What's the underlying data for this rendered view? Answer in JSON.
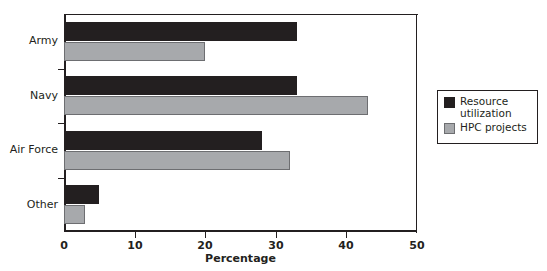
{
  "chart_data": {
    "type": "bar",
    "orientation": "horizontal",
    "title": "",
    "xlabel": "Percentage",
    "ylabel": "",
    "categories": [
      "Army",
      "Navy",
      "Air Force",
      "Other"
    ],
    "series": [
      {
        "name": "Resource utilization",
        "color": "#231f20",
        "values": [
          33,
          33,
          28,
          5
        ]
      },
      {
        "name": "HPC projects",
        "color": "#a7a9ac",
        "values": [
          20,
          43,
          32,
          3
        ]
      }
    ],
    "xlim": [
      0,
      50
    ],
    "xticks": [
      0,
      10,
      20,
      30,
      40,
      50
    ],
    "xtick_labels": [
      "0",
      "10",
      "20",
      "30",
      "40",
      "50"
    ],
    "grid": false,
    "legend_position": "right-outside",
    "legend_entries": [
      "Resource utilization",
      "HPC projects"
    ]
  },
  "legend": {
    "items": [
      {
        "label": "Resource utilization",
        "swatch": "dark-square-swatch"
      },
      {
        "label": "HPC projects",
        "swatch": "light-square-swatch"
      }
    ]
  },
  "axis": {
    "x_title": "Percentage"
  }
}
